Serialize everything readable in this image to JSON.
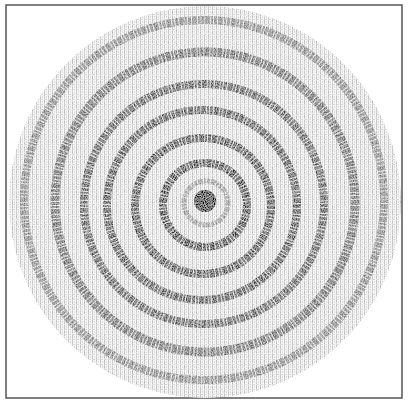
{
  "figure": {
    "kind": "character-printed concentric ring pattern (scanned)",
    "frame": {
      "x": 6,
      "y": 5,
      "width": 396,
      "height": 393,
      "stroke": "#555555"
    },
    "disc": {
      "cx": 205,
      "cy": 202,
      "r": 196,
      "fill": "#e6e6e6"
    },
    "center_blob": {
      "cx": 205,
      "cy": 201,
      "r": 11,
      "fill": "#0a0a0a"
    },
    "colors": {
      "background": "#ffffff",
      "ring_dark": "#1a1a1a",
      "halftone": "#bdbdbd"
    },
    "rings": [
      {
        "cx": 206,
        "cy": 203,
        "r": 22,
        "width": 5,
        "opacity": 0.35
      },
      {
        "cx": 205,
        "cy": 205,
        "r": 42,
        "width": 8,
        "opacity": 0.85
      },
      {
        "cx": 203,
        "cy": 206,
        "r": 68,
        "width": 8,
        "opacity": 0.8
      },
      {
        "cx": 202,
        "cy": 205,
        "r": 95,
        "width": 8,
        "opacity": 0.75
      },
      {
        "cx": 204,
        "cy": 204,
        "r": 120,
        "width": 8,
        "opacity": 0.7
      },
      {
        "cx": 205,
        "cy": 202,
        "r": 150,
        "width": 9,
        "opacity": 0.6
      },
      {
        "cx": 204,
        "cy": 200,
        "r": 180,
        "width": 8,
        "opacity": 0.45
      }
    ]
  }
}
